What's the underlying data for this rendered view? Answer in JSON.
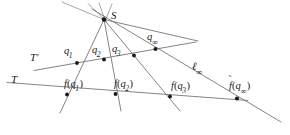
{
  "figure": {
    "canvas": {
      "width": 290,
      "height": 135
    },
    "background_color": "#ffffff",
    "line_color": "#6e6e72",
    "point_color": "#1a1a1a",
    "labels": {
      "center": "S",
      "line_T_upper": "T",
      "line_T_upper_prime": "′",
      "line_T_lower": "T",
      "line_infinity_l": "ℓ",
      "subscript_infinity": "∞",
      "q1_base": "q",
      "q1_sub": "1",
      "q2_base": "q",
      "q2_sub": "2",
      "q3_base": "q",
      "q3_sub": "3",
      "qinf_base": "q",
      "qinf_sub": "∞",
      "f_symbol": "f",
      "tilde_mark": "˜",
      "paren_open": "(",
      "paren_close": ")",
      "fq1_text": "f(q₁)",
      "fq2_text": "f(q₂)",
      "fq3_text": "f(q₃)",
      "fqinf_text": "f̃(q∞)"
    },
    "points": [
      {
        "id": "S",
        "label": "S",
        "x": 104.0,
        "y": 19.5,
        "r": 2.1
      },
      {
        "id": "q1",
        "label": "q1",
        "x": 77.0,
        "y": 63.0,
        "r": 1.9
      },
      {
        "id": "q2",
        "label": "q2",
        "x": 104.0,
        "y": 59.5,
        "r": 1.9
      },
      {
        "id": "q3",
        "label": "q3",
        "x": 134.0,
        "y": 55.5,
        "r": 1.9
      },
      {
        "id": "qinf",
        "label": "qinf",
        "x": 155.5,
        "y": 49.0,
        "r": 2.0
      },
      {
        "id": "fq1",
        "label": "f(q1)",
        "x": 67.0,
        "y": 94.5,
        "r": 1.9
      },
      {
        "id": "fq2",
        "label": "f(q2)",
        "x": 115.5,
        "y": 94.0,
        "r": 1.9
      },
      {
        "id": "fq3",
        "label": "f(q3)",
        "x": 170.0,
        "y": 96.5,
        "r": 1.9
      },
      {
        "id": "fqinf",
        "label": "ftilde(qinf)",
        "x": 237.0,
        "y": 98.5,
        "r": 2.1
      }
    ],
    "lines": [
      {
        "id": "line-T-upper",
        "name": "T'",
        "x1": 34.0,
        "y1": 70.0,
        "x2": 192.0,
        "y2": 42.5
      },
      {
        "id": "line-T-lower",
        "name": "T",
        "x1": 7.0,
        "y1": 82.5,
        "x2": 232.0,
        "y2": 99.5
      },
      {
        "id": "line-l-inf",
        "name": "l_inf",
        "x1": 104.0,
        "y1": 19.5,
        "x2": 281.0,
        "y2": 122.0
      },
      {
        "id": "ray-S-q1",
        "name": "S-q1",
        "x1": 95.5,
        "y1": 6.0,
        "x2": 62.0,
        "y2": 112.0
      },
      {
        "id": "ray-S-q2",
        "name": "S-q2",
        "x1": 104.5,
        "y1": 5.0,
        "x2": 120.0,
        "y2": 110.5
      },
      {
        "id": "ray-S-q3",
        "name": "S-q3",
        "x1": 110.0,
        "y1": 5.5,
        "x2": 179.0,
        "y2": 110.0
      },
      {
        "id": "ray-extra-a",
        "name": "extra-up-left",
        "x1": 73.0,
        "y1": 5.0,
        "x2": 104.0,
        "y2": 19.5
      },
      {
        "id": "ray-extra-b",
        "name": "extra-up-right",
        "x1": 98.5,
        "y1": 3.0,
        "x2": 104.0,
        "y2": 19.5
      },
      {
        "id": "ray-extra-c",
        "name": "extra-down-left",
        "x1": 104.0,
        "y1": 19.5,
        "x2": 84.5,
        "y2": 118.0
      },
      {
        "id": "ray-extra-d",
        "name": "extra-right",
        "x1": 104.0,
        "y1": 19.5,
        "x2": 196.0,
        "y2": 41.0
      }
    ],
    "label_positions": [
      {
        "id": "label-S",
        "text": "S",
        "left": 111,
        "top": 11
      },
      {
        "id": "label-Tp",
        "text": "T'",
        "left": 30,
        "top": 53
      },
      {
        "id": "label-T",
        "text": "T",
        "left": 11,
        "top": 75
      },
      {
        "id": "label-q1",
        "text": "q1",
        "left": 64,
        "top": 46
      },
      {
        "id": "label-q2",
        "text": "q2",
        "left": 92,
        "top": 45
      },
      {
        "id": "label-q3",
        "text": "q3",
        "left": 112,
        "top": 44
      },
      {
        "id": "label-qinf",
        "text": "qinf",
        "left": 148,
        "top": 32
      },
      {
        "id": "label-linf",
        "text": "l_inf",
        "left": 192,
        "top": 62
      },
      {
        "id": "label-fq1",
        "text": "f(q1)",
        "left": 66,
        "top": 79
      },
      {
        "id": "label-fq2",
        "text": "f(q2)",
        "left": 116,
        "top": 79
      },
      {
        "id": "label-fq3",
        "text": "f(q3)",
        "left": 172,
        "top": 81
      },
      {
        "id": "label-fqinf",
        "text": "ftilde(qinf)",
        "left": 230,
        "top": 81
      }
    ]
  }
}
